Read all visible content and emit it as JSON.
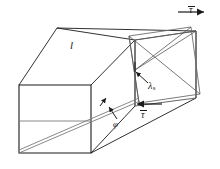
{
  "figure": {
    "kind": "engineering-diagram",
    "labels": {
      "length": "l",
      "shear_stress_top": "τ",
      "shear_stress_bottom": "τ",
      "shear_angle_symbol": "λ",
      "shear_angle_subscript": "s",
      "twist_angle": "φ"
    },
    "colors": {
      "stroke_dark": "#1a1a1a",
      "stroke_mid": "#555555",
      "stroke_light": "#8a8a8a",
      "background": "#ffffff"
    },
    "geometry": {
      "front_face": [
        [
          19,
          85
        ],
        [
          91,
          85
        ],
        [
          91,
          153
        ],
        [
          19,
          153
        ]
      ],
      "back_top_left": [
        57,
        28
      ],
      "back_face_right_x": 196,
      "undeformed_end_face": [
        [
          135,
          40
        ],
        [
          196,
          31
        ],
        [
          196,
          98
        ],
        [
          135,
          106
        ]
      ],
      "deformed_end_face": [
        [
          129,
          36
        ],
        [
          191,
          27
        ],
        [
          200,
          94
        ],
        [
          139,
          103
        ]
      ],
      "helix_line": [
        [
          19,
          153
        ],
        [
          140,
          100
        ]
      ],
      "top_arrow": {
        "from": [
          178,
          12
        ],
        "to": [
          207,
          12
        ],
        "direction": "right"
      },
      "bottom_arrow": {
        "from": [
          162,
          104
        ],
        "to": [
          134,
          104
        ],
        "direction": "left"
      },
      "lambda_leader": {
        "from": [
          147,
          82
        ],
        "to": [
          135,
          72
        ]
      },
      "phi_leader": {
        "from": [
          116,
          118
        ],
        "to": [
          108,
          106
        ]
      }
    }
  }
}
